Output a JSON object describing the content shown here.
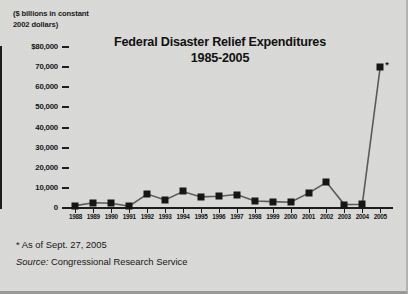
{
  "figure": {
    "units_caption": "($ billions in constant\n2002 dollars)",
    "title_line1": "Federal Disaster Relief Expenditures",
    "title_line2": "1985-2005",
    "asterisk_marker": "*",
    "footnote_asof": "* As of Sept. 27, 2005",
    "footnote_source_label": "Source:",
    "footnote_source_value": " Congressional Research Service",
    "colors": {
      "background": "#d9d9d7",
      "ink": "#161616",
      "axis": "#1d1d1d"
    }
  },
  "chart_data": {
    "type": "line",
    "title": "Federal Disaster Relief Expenditures 1985-2005",
    "subtitle": "",
    "xlabel": "",
    "ylabel": "($ billions in constant 2002 dollars)",
    "ylim": [
      0,
      80000
    ],
    "ytick_labels": [
      "$80,000",
      "70,000",
      "60,000",
      "50,000",
      "40,000",
      "30,000",
      "20,000",
      "10,000",
      "0"
    ],
    "ytick_values": [
      80000,
      70000,
      60000,
      50000,
      40000,
      30000,
      20000,
      10000,
      0
    ],
    "grid": false,
    "legend": "none",
    "marker": "filled-square",
    "categories": [
      "1988",
      "1989",
      "1990",
      "1991",
      "1992",
      "1993",
      "1994",
      "1995",
      "1996",
      "1997",
      "1998",
      "1999",
      "2000",
      "2001",
      "2002",
      "2003",
      "2004",
      "2005"
    ],
    "values": [
      1200,
      2600,
      2400,
      900,
      6900,
      4000,
      8200,
      5500,
      5800,
      6700,
      3500,
      3200,
      2900,
      7400,
      12800,
      1700,
      1900,
      70000
    ],
    "annotations": [
      {
        "x": "2005",
        "text": "*",
        "note": "As of Sept. 27, 2005"
      }
    ]
  }
}
